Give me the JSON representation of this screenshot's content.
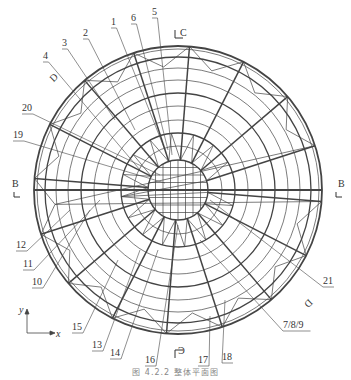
{
  "figure": {
    "caption": "图 4.2.2  整体平面图",
    "center": {
      "x": 178,
      "y": 190
    },
    "outer_radius": 144,
    "inner_radius": 30,
    "ring_radii": [
      44,
      57,
      70,
      84,
      97,
      110,
      122,
      133,
      144
    ],
    "radial_count": 16,
    "colors": {
      "line": "#444444",
      "text": "#333333",
      "background": "#ffffff"
    }
  },
  "section_markers": [
    {
      "id": "B-left",
      "label": "B",
      "x": 12,
      "y": 178
    },
    {
      "id": "B-right",
      "label": "B",
      "x": 338,
      "y": 178
    },
    {
      "id": "C-top",
      "label": "C",
      "x": 180,
      "y": 27
    },
    {
      "id": "C-bottom",
      "label": "C",
      "x": 178,
      "y": 345
    },
    {
      "id": "D-top",
      "label": "D",
      "x": 50,
      "y": 72
    },
    {
      "id": "D-bottom",
      "label": "D",
      "x": 305,
      "y": 298
    }
  ],
  "member_labels": [
    {
      "text": "1",
      "x": 111,
      "y": 17
    },
    {
      "text": "2",
      "x": 83,
      "y": 28
    },
    {
      "text": "3",
      "x": 62,
      "y": 38
    },
    {
      "text": "4",
      "x": 43,
      "y": 51
    },
    {
      "text": "5",
      "x": 152,
      "y": 7
    },
    {
      "text": "6",
      "x": 131,
      "y": 13
    },
    {
      "text": "20",
      "x": 22,
      "y": 103
    },
    {
      "text": "19",
      "x": 13,
      "y": 130
    },
    {
      "text": "12",
      "x": 16,
      "y": 240
    },
    {
      "text": "11",
      "x": 23,
      "y": 259
    },
    {
      "text": "10",
      "x": 32,
      "y": 277
    },
    {
      "text": "15",
      "x": 72,
      "y": 322
    },
    {
      "text": "13",
      "x": 92,
      "y": 340
    },
    {
      "text": "14",
      "x": 110,
      "y": 348
    },
    {
      "text": "16",
      "x": 145,
      "y": 355
    },
    {
      "text": "17",
      "x": 198,
      "y": 355
    },
    {
      "text": "18",
      "x": 222,
      "y": 352
    },
    {
      "text": "7/8/9",
      "x": 283,
      "y": 320
    },
    {
      "text": "21",
      "x": 323,
      "y": 276
    }
  ],
  "axes": {
    "x_label": "x",
    "y_label": "y",
    "origin": {
      "x": 27,
      "y": 333
    }
  }
}
